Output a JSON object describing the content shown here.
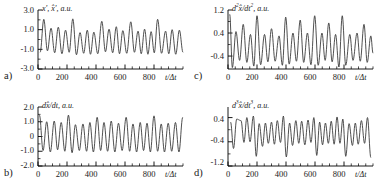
{
  "figure": {
    "panels": [
      {
        "key": "a",
        "letter": "a)",
        "ylabel_html": "x', x̂', a.u.",
        "xlabel": "t/Δt",
        "yticks": [
          "3.0",
          "1.0",
          "-1.0",
          "-3.0"
        ],
        "ytick_values": [
          3.0,
          1.0,
          -1.0,
          -3.0
        ],
        "xticks": [
          "0",
          "200",
          "400",
          "600",
          "800"
        ],
        "xtick_values": [
          0,
          200,
          400,
          600,
          800
        ]
      },
      {
        "key": "b",
        "letter": "b)",
        "ylabel_html": "dx̂/dt, a.u.",
        "xlabel": "t/Δt",
        "yticks": [
          "2.0",
          "1.0",
          "0",
          "-1.0",
          "-2.0"
        ],
        "ytick_values": [
          2.0,
          1.0,
          0.0,
          -1.0,
          -2.0
        ],
        "xticks": [
          "0",
          "200",
          "400",
          "600",
          "800"
        ],
        "xtick_values": [
          0,
          200,
          400,
          600,
          800
        ]
      },
      {
        "key": "c",
        "letter": "c)",
        "ylabel_html": "d<sup>2</sup>x̂/dt<sup>2</sup>, a.u.",
        "xlabel": "t/Δt",
        "yticks": [
          "1.2",
          "0.4",
          "-0.4"
        ],
        "ytick_values": [
          1.2,
          0.4,
          -0.4
        ],
        "xticks": [
          "0",
          "200",
          "400",
          "600",
          "800"
        ],
        "xtick_values": [
          0,
          200,
          400,
          600,
          800
        ]
      },
      {
        "key": "d",
        "letter": "d)",
        "ylabel_html": "d<sup>3</sup>x̂/dt<sup>3</sup>, a.u.",
        "xlabel": "t/Δt",
        "yticks": [
          "0.4",
          "-0.4",
          "-1.2"
        ],
        "ytick_values": [
          0.4,
          -0.4,
          -1.2
        ],
        "xticks": [
          "0",
          "200",
          "400",
          "600",
          "800"
        ],
        "xtick_values": [
          0,
          200,
          400,
          600,
          800
        ]
      }
    ],
    "line_color": "#303030",
    "axis_color": "#000000"
  },
  "chart_data": [
    {
      "type": "line",
      "panel": "a",
      "title": "",
      "xlabel": "t/Δt",
      "ylabel": "x', x̂', a.u.",
      "xlim": [
        0,
        1000
      ],
      "ylim": [
        -3.0,
        3.0
      ],
      "xticks": [
        0,
        200,
        400,
        600,
        800
      ],
      "yticks": [
        3.0,
        1.0,
        -1.0,
        -3.0
      ],
      "minor_xtick_step": 50,
      "grid": false,
      "legend": "none",
      "series": [
        {
          "name": "x', x̂'",
          "comment": "quasi-periodic oscillation, base period ~100 dt, alternating tall (~2.0) and short (~1.0) peaks, troughs near -1.6",
          "peaks": [
            {
              "x": 40,
              "y": 2.05
            },
            {
              "x": 90,
              "y": 1.15
            },
            {
              "x": 140,
              "y": 1.25
            },
            {
              "x": 190,
              "y": 0.95
            },
            {
              "x": 240,
              "y": 2.1
            },
            {
              "x": 290,
              "y": 0.7
            },
            {
              "x": 340,
              "y": 0.95
            },
            {
              "x": 385,
              "y": 0.75
            },
            {
              "x": 440,
              "y": 1.85
            },
            {
              "x": 490,
              "y": 1.05
            },
            {
              "x": 540,
              "y": 1.3
            },
            {
              "x": 585,
              "y": 0.9
            },
            {
              "x": 640,
              "y": 1.8
            },
            {
              "x": 690,
              "y": 0.85
            },
            {
              "x": 735,
              "y": 1.05
            },
            {
              "x": 780,
              "y": 0.8
            },
            {
              "x": 825,
              "y": 2.05
            },
            {
              "x": 880,
              "y": 0.85
            },
            {
              "x": 925,
              "y": 1.0
            },
            {
              "x": 975,
              "y": 0.95
            }
          ],
          "troughs": [
            {
              "x": 15,
              "y": -1.3
            },
            {
              "x": 65,
              "y": -1.15
            },
            {
              "x": 115,
              "y": -1.35
            },
            {
              "x": 165,
              "y": -1.45
            },
            {
              "x": 215,
              "y": -1.3
            },
            {
              "x": 265,
              "y": -1.55
            },
            {
              "x": 315,
              "y": -1.4
            },
            {
              "x": 362,
              "y": -1.5
            },
            {
              "x": 412,
              "y": -1.45
            },
            {
              "x": 465,
              "y": -1.25
            },
            {
              "x": 515,
              "y": -1.35
            },
            {
              "x": 562,
              "y": -1.45
            },
            {
              "x": 612,
              "y": -1.4
            },
            {
              "x": 665,
              "y": -1.3
            },
            {
              "x": 712,
              "y": -1.45
            },
            {
              "x": 758,
              "y": -1.5
            },
            {
              "x": 802,
              "y": -1.35
            },
            {
              "x": 852,
              "y": -1.4
            },
            {
              "x": 902,
              "y": -1.45
            },
            {
              "x": 950,
              "y": -1.5
            },
            {
              "x": 1000,
              "y": -1.3
            }
          ]
        }
      ]
    },
    {
      "type": "line",
      "panel": "b",
      "title": "",
      "xlabel": "t/Δt",
      "ylabel": "dx̂/dt, a.u.",
      "xlim": [
        0,
        1000
      ],
      "ylim": [
        -2.0,
        2.0
      ],
      "xticks": [
        0,
        200,
        400,
        600,
        800
      ],
      "yticks": [
        2.0,
        1.0,
        0.0,
        -1.0,
        -2.0
      ],
      "minor_xtick_step": 50,
      "grid": false,
      "legend": "none",
      "series": [
        {
          "name": "dx̂/dt",
          "comment": "first derivative; peaks ~1.0-1.5, troughs ~-1.0, roughly sinusoidal with alternating amplitude",
          "peaks": [
            {
              "x": 10,
              "y": 1.45
            },
            {
              "x": 60,
              "y": 1.0
            },
            {
              "x": 112,
              "y": 1.05
            },
            {
              "x": 160,
              "y": 0.95
            },
            {
              "x": 210,
              "y": 1.45
            },
            {
              "x": 258,
              "y": 0.8
            },
            {
              "x": 310,
              "y": 0.85
            },
            {
              "x": 358,
              "y": 0.95
            },
            {
              "x": 408,
              "y": 1.3
            },
            {
              "x": 455,
              "y": 0.95
            },
            {
              "x": 505,
              "y": 1.05
            },
            {
              "x": 555,
              "y": 0.9
            },
            {
              "x": 608,
              "y": 1.3
            },
            {
              "x": 655,
              "y": 0.85
            },
            {
              "x": 705,
              "y": 0.95
            },
            {
              "x": 752,
              "y": 0.9
            },
            {
              "x": 800,
              "y": 1.4
            },
            {
              "x": 850,
              "y": 0.85
            },
            {
              "x": 898,
              "y": 0.9
            },
            {
              "x": 948,
              "y": 0.95
            },
            {
              "x": 998,
              "y": 1.3
            }
          ],
          "troughs": [
            {
              "x": 35,
              "y": -0.95
            },
            {
              "x": 85,
              "y": -1.05
            },
            {
              "x": 135,
              "y": -0.9
            },
            {
              "x": 185,
              "y": -1.0
            },
            {
              "x": 235,
              "y": -1.1
            },
            {
              "x": 285,
              "y": -0.95
            },
            {
              "x": 335,
              "y": -1.0
            },
            {
              "x": 382,
              "y": -1.05
            },
            {
              "x": 432,
              "y": -0.95
            },
            {
              "x": 480,
              "y": -1.0
            },
            {
              "x": 530,
              "y": -1.05
            },
            {
              "x": 580,
              "y": -0.95
            },
            {
              "x": 632,
              "y": -1.0
            },
            {
              "x": 680,
              "y": -1.05
            },
            {
              "x": 728,
              "y": -0.95
            },
            {
              "x": 775,
              "y": -1.05
            },
            {
              "x": 825,
              "y": -1.0
            },
            {
              "x": 872,
              "y": -1.05
            },
            {
              "x": 922,
              "y": -1.0
            },
            {
              "x": 972,
              "y": -1.05
            }
          ]
        }
      ]
    },
    {
      "type": "line",
      "panel": "c",
      "title": "",
      "xlabel": "t/Δt",
      "ylabel": "d2x̂/dt2, a.u.",
      "xlim": [
        0,
        1000
      ],
      "ylim": [
        -0.85,
        1.2
      ],
      "xticks": [
        0,
        200,
        400,
        600,
        800
      ],
      "yticks": [
        1.2,
        0.4,
        -0.4
      ],
      "minor_xtick_step": 50,
      "grid": false,
      "legend": "none",
      "series": [
        {
          "name": "d2x̂/dt2",
          "comment": "second derivative; sharp tall peaks near 1.0 with deep narrow troughs near -0.8",
          "peaks": [
            {
              "x": 12,
              "y": 1.05
            },
            {
              "x": 55,
              "y": 0.45
            },
            {
              "x": 105,
              "y": 0.7
            },
            {
              "x": 155,
              "y": 0.35
            },
            {
              "x": 200,
              "y": 1.0
            },
            {
              "x": 252,
              "y": 0.35
            },
            {
              "x": 300,
              "y": 0.55
            },
            {
              "x": 352,
              "y": 0.3
            },
            {
              "x": 398,
              "y": 0.95
            },
            {
              "x": 448,
              "y": 0.4
            },
            {
              "x": 498,
              "y": 0.85
            },
            {
              "x": 548,
              "y": 0.4
            },
            {
              "x": 598,
              "y": 1.0
            },
            {
              "x": 648,
              "y": 0.4
            },
            {
              "x": 695,
              "y": 0.75
            },
            {
              "x": 742,
              "y": 0.35
            },
            {
              "x": 788,
              "y": 1.0
            },
            {
              "x": 840,
              "y": 0.35
            },
            {
              "x": 890,
              "y": 0.4
            },
            {
              "x": 938,
              "y": 0.7
            },
            {
              "x": 985,
              "y": 0.3
            }
          ],
          "troughs": [
            {
              "x": 30,
              "y": -0.8
            },
            {
              "x": 80,
              "y": -0.55
            },
            {
              "x": 130,
              "y": -0.62
            },
            {
              "x": 178,
              "y": -0.75
            },
            {
              "x": 225,
              "y": -0.7
            },
            {
              "x": 275,
              "y": -0.6
            },
            {
              "x": 325,
              "y": -0.58
            },
            {
              "x": 375,
              "y": -0.72
            },
            {
              "x": 422,
              "y": -0.68
            },
            {
              "x": 472,
              "y": -0.58
            },
            {
              "x": 522,
              "y": -0.62
            },
            {
              "x": 572,
              "y": -0.7
            },
            {
              "x": 622,
              "y": -0.72
            },
            {
              "x": 670,
              "y": -0.55
            },
            {
              "x": 718,
              "y": -0.6
            },
            {
              "x": 765,
              "y": -0.78
            },
            {
              "x": 812,
              "y": -0.72
            },
            {
              "x": 862,
              "y": -0.55
            },
            {
              "x": 912,
              "y": -0.58
            },
            {
              "x": 960,
              "y": -0.62
            },
            {
              "x": 1000,
              "y": -0.3
            }
          ]
        }
      ]
    },
    {
      "type": "line",
      "panel": "d",
      "title": "",
      "xlabel": "t/Δt",
      "ylabel": "d3x̂/dt3, a.u.",
      "xlim": [
        0,
        1000
      ],
      "ylim": [
        -1.2,
        0.75
      ],
      "xticks": [
        0,
        200,
        400,
        600,
        800
      ],
      "yticks": [
        0.4,
        -0.4,
        -1.2
      ],
      "minor_xtick_step": 50,
      "grid": false,
      "legend": "none",
      "series": [
        {
          "name": "d3x̂/dt3",
          "comment": "third derivative; flat-topped notched plateaus near 0.3-0.45 and deep sharp troughs near -0.9",
          "peaks": [
            {
              "x": 18,
              "y": 0.25
            },
            {
              "x": 60,
              "y": 0.35
            },
            {
              "x": 90,
              "y": 0.3
            },
            {
              "x": 130,
              "y": 0.4
            },
            {
              "x": 175,
              "y": 0.45
            },
            {
              "x": 215,
              "y": 0.2
            },
            {
              "x": 258,
              "y": 0.22
            },
            {
              "x": 300,
              "y": 0.25
            },
            {
              "x": 340,
              "y": 0.3
            },
            {
              "x": 382,
              "y": 0.45
            },
            {
              "x": 425,
              "y": 0.22
            },
            {
              "x": 468,
              "y": 0.3
            },
            {
              "x": 508,
              "y": 0.28
            },
            {
              "x": 552,
              "y": 0.32
            },
            {
              "x": 592,
              "y": 0.4
            },
            {
              "x": 632,
              "y": 0.25
            },
            {
              "x": 672,
              "y": 0.22
            },
            {
              "x": 712,
              "y": 0.28
            },
            {
              "x": 752,
              "y": 0.42
            },
            {
              "x": 792,
              "y": 0.35
            },
            {
              "x": 835,
              "y": 0.2
            },
            {
              "x": 878,
              "y": 0.22
            },
            {
              "x": 920,
              "y": 0.3
            },
            {
              "x": 962,
              "y": 0.4
            }
          ],
          "troughs": [
            {
              "x": 38,
              "y": -0.62
            },
            {
              "x": 110,
              "y": -0.42
            },
            {
              "x": 152,
              "y": -0.4
            },
            {
              "x": 195,
              "y": -0.88
            },
            {
              "x": 238,
              "y": -0.55
            },
            {
              "x": 278,
              "y": -0.45
            },
            {
              "x": 320,
              "y": -0.48
            },
            {
              "x": 362,
              "y": -0.42
            },
            {
              "x": 402,
              "y": -0.9
            },
            {
              "x": 445,
              "y": -0.52
            },
            {
              "x": 488,
              "y": -0.45
            },
            {
              "x": 530,
              "y": -0.5
            },
            {
              "x": 572,
              "y": -0.42
            },
            {
              "x": 612,
              "y": -0.85
            },
            {
              "x": 652,
              "y": -0.5
            },
            {
              "x": 692,
              "y": -0.45
            },
            {
              "x": 732,
              "y": -0.48
            },
            {
              "x": 772,
              "y": -0.45
            },
            {
              "x": 812,
              "y": -0.88
            },
            {
              "x": 858,
              "y": -0.52
            },
            {
              "x": 898,
              "y": -0.48
            },
            {
              "x": 942,
              "y": -0.45
            },
            {
              "x": 985,
              "y": -0.92
            }
          ]
        }
      ]
    }
  ]
}
